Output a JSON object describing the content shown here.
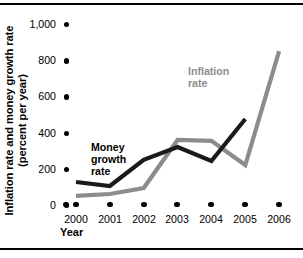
{
  "figure": {
    "y_axis_title_line1": "Inflation rate and money growth rate",
    "y_axis_title_line2": "(percent per year)",
    "x_axis_title": "Year"
  },
  "chart_data": {
    "type": "line",
    "title": "",
    "xlabel": "Year",
    "ylabel": "Inflation rate and money growth rate (percent per year)",
    "x": [
      2000,
      2001,
      2002,
      2003,
      2004,
      2005,
      2006
    ],
    "categories": [
      "2000",
      "2001",
      "2002",
      "2003",
      "2004",
      "2005",
      "2006"
    ],
    "ylim": [
      0,
      1000
    ],
    "xlim": [
      2000,
      2006
    ],
    "ytick_values": [
      0,
      200,
      400,
      600,
      800,
      1000
    ],
    "ytick_labels": [
      "0",
      "200",
      "400",
      "600",
      "800",
      "1,000"
    ],
    "xtick_labels": [
      "2000",
      "2001",
      "2002",
      "2003",
      "2004",
      "2005",
      "2006"
    ],
    "grid": false,
    "legend": "inline-annotations",
    "series": [
      {
        "name": "Money growth rate",
        "color": "#1a1a1a",
        "x": [
          2000,
          2001,
          2002,
          2003,
          2004,
          2005
        ],
        "values": [
          127,
          105,
          249,
          320,
          243,
          475
        ]
      },
      {
        "name": "Inflation rate",
        "color": "#8c8c8c",
        "x": [
          2000,
          2001,
          2002,
          2003,
          2004,
          2005,
          2006
        ],
        "values": [
          50,
          61,
          94,
          359,
          354,
          221,
          850
        ]
      }
    ],
    "annotations": [
      {
        "text": "Money growth rate",
        "color": "#1a1a1a"
      },
      {
        "text": "Inflation rate",
        "color": "#8c8c8c"
      }
    ]
  },
  "yticks": [
    {
      "label": "1,000"
    },
    {
      "label": "800"
    },
    {
      "label": "600"
    },
    {
      "label": "400"
    },
    {
      "label": "200"
    },
    {
      "label": "0"
    }
  ],
  "xticks": [
    {
      "label": "2000"
    },
    {
      "label": "2001"
    },
    {
      "label": "2002"
    },
    {
      "label": "2003"
    },
    {
      "label": "2004"
    },
    {
      "label": "2005"
    },
    {
      "label": "2006"
    }
  ],
  "labels": {
    "money_growth_line1": "Money",
    "money_growth_line2": "growth",
    "money_growth_line3": "rate",
    "inflation_line1": "Inflation",
    "inflation_line2": "rate"
  },
  "colors": {
    "money_growth": "#1a1a1a",
    "inflation": "#8c8c8c",
    "axis": "#000000",
    "background": "#ffffff"
  }
}
